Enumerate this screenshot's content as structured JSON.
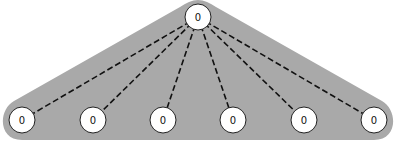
{
  "diagram": {
    "type": "star-tree",
    "background_region_color": "#a9a9a9",
    "edge_style": "dashed",
    "edge_color": "#111111",
    "node_fill": "#ffffff",
    "node_stroke": "#222222",
    "root": {
      "id": "root",
      "label": "0",
      "x": 198,
      "y": 17
    },
    "children": [
      {
        "id": "c1",
        "label": "0",
        "x": 22,
        "y": 120
      },
      {
        "id": "c2",
        "label": "0",
        "x": 93,
        "y": 120
      },
      {
        "id": "c3",
        "label": "0",
        "x": 163,
        "y": 120
      },
      {
        "id": "c4",
        "label": "0",
        "x": 233,
        "y": 120
      },
      {
        "id": "c5",
        "label": "0",
        "x": 304,
        "y": 120
      },
      {
        "id": "c6",
        "label": "0",
        "x": 374,
        "y": 120
      }
    ],
    "node_radius": 13
  }
}
